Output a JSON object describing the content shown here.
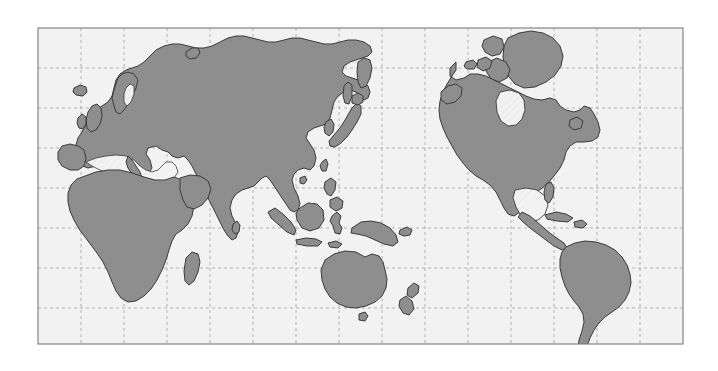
{
  "figure": {
    "type": "world-map-equirectangular",
    "canvas": {
      "width": 718,
      "height": 371
    },
    "plot_frame": {
      "x": 38,
      "y": 28,
      "width": 645,
      "height": 316
    },
    "background_color": "#ffffff",
    "ocean_color": "#f2f2f2",
    "land_color": "#8e8e8e",
    "land_outline_color": "#3a3a3a",
    "land_outline_width": 1,
    "frame_border_color": "#7a7a7a",
    "grid": {
      "visible": true,
      "style": "dashed",
      "color": "#9a9a9a",
      "dash_pattern": "3 3",
      "line_width": 0.7,
      "x_spacing_px": 43,
      "y_spacing_px": 43,
      "vertical_line_count": 15,
      "horizontal_line_count": 7
    },
    "projection": {
      "name": "equirectangular",
      "lon_range": [
        -20,
        340
      ],
      "lat_range": [
        -60,
        85
      ],
      "graticule_interval_deg": 24
    },
    "land_texture": {
      "pattern": "diagonal-hatch",
      "opacity": 0.12,
      "color": "#6d6d6d"
    },
    "axis_labels": {
      "x": "",
      "y": ""
    },
    "tick_labels": {
      "x": [],
      "y": []
    },
    "legend": {
      "visible": false,
      "entries": []
    },
    "annotations": []
  },
  "chart_data": {
    "type": "map",
    "xlabel": "",
    "ylabel": "",
    "grid": true,
    "legend_position": "none",
    "landmasses": [
      {
        "name": "Eurasia",
        "label": "eurasia-landmass"
      },
      {
        "name": "Africa",
        "label": "africa-landmass"
      },
      {
        "name": "North America",
        "label": "north-america-landmass"
      },
      {
        "name": "South America",
        "label": "south-america-landmass"
      },
      {
        "name": "Greenland",
        "label": "greenland-landmass"
      },
      {
        "name": "Australia",
        "label": "australia-landmass"
      },
      {
        "name": "New Guinea",
        "label": "new-guinea-landmass"
      },
      {
        "name": "New Zealand",
        "label": "new-zealand-landmass"
      },
      {
        "name": "Japan",
        "label": "japan-landmass"
      },
      {
        "name": "Madagascar",
        "label": "madagascar-landmass"
      },
      {
        "name": "British Isles",
        "label": "british-isles-landmass"
      },
      {
        "name": "Iceland",
        "label": "iceland-landmass"
      },
      {
        "name": "Borneo",
        "label": "borneo-landmass"
      },
      {
        "name": "Sumatra",
        "label": "sumatra-landmass"
      },
      {
        "name": "Java",
        "label": "java-landmass"
      },
      {
        "name": "Sulawesi",
        "label": "sulawesi-landmass"
      },
      {
        "name": "Philippines",
        "label": "philippines-landmass"
      },
      {
        "name": "Sri Lanka",
        "label": "sri-lanka-landmass"
      },
      {
        "name": "Cuba",
        "label": "cuba-landmass"
      },
      {
        "name": "Hispaniola",
        "label": "hispaniola-landmass"
      },
      {
        "name": "Taiwan",
        "label": "taiwan-landmass"
      },
      {
        "name": "Sakhalin",
        "label": "sakhalin-landmass"
      },
      {
        "name": "Tasmania",
        "label": "tasmania-landmass"
      },
      {
        "name": "Newfoundland",
        "label": "newfoundland-landmass"
      },
      {
        "name": "Baffin Island",
        "label": "baffin-island-landmass"
      },
      {
        "name": "Victoria Island",
        "label": "victoria-island-landmass"
      },
      {
        "name": "Ellesmere Island",
        "label": "ellesmere-island-landmass"
      },
      {
        "name": "Novaya Zemlya",
        "label": "novaya-zemlya-landmass"
      },
      {
        "name": "Hainan",
        "label": "hainan-landmass"
      },
      {
        "name": "Timor",
        "label": "timor-landmass"
      }
    ]
  }
}
